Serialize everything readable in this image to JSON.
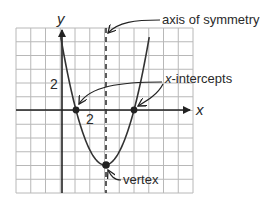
{
  "diagram": {
    "type": "parabola-anatomy",
    "equation_implied": "y = (x-1)(x-5)",
    "grid": {
      "x_min": -3,
      "x_max": 9,
      "y_min": -6,
      "y_max": 6,
      "step": 1
    },
    "axes": {
      "x_label": "x",
      "y_label": "y",
      "x_tick_label": "2",
      "y_tick_label": "2"
    },
    "features": {
      "axis_of_symmetry": {
        "x": 3,
        "label": "axis of symmetry"
      },
      "x_intercepts": {
        "points": [
          [
            1,
            0
          ],
          [
            5,
            0
          ]
        ],
        "label_prefix": "x",
        "label_suffix": "-intercepts"
      },
      "vertex": {
        "point": [
          3,
          -4
        ],
        "label": "vertex"
      }
    },
    "colors": {
      "grid": "#b8b8b8",
      "axis": "#222222",
      "curve": "#333333",
      "text": "#2a2a2a"
    }
  }
}
